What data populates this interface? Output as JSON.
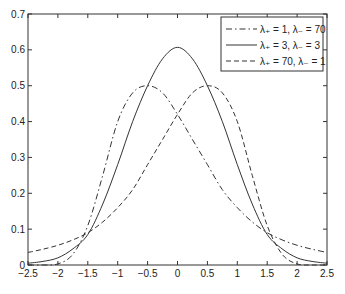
{
  "chart_data": {
    "type": "line",
    "title": "",
    "xlabel": "",
    "ylabel": "",
    "xlim": [
      -2.5,
      2.5
    ],
    "ylim": [
      0,
      0.7
    ],
    "xticks": [
      "-2.5",
      "-2",
      "-1.5",
      "-1",
      "-0.5",
      "0",
      "0.5",
      "1",
      "1.5",
      "2",
      "2.5"
    ],
    "yticks": [
      "0",
      "0.1",
      "0.2",
      "0.3",
      "0.4",
      "0.5",
      "0.6",
      "0.7"
    ],
    "grid": false,
    "legend_position": "upper right",
    "x": [
      -2.5,
      -2.25,
      -2.0,
      -1.75,
      -1.5,
      -1.25,
      -1.0,
      -0.75,
      -0.5,
      -0.25,
      0.0,
      0.25,
      0.5,
      0.75,
      1.0,
      1.25,
      1.5,
      1.75,
      2.0,
      2.25,
      2.5
    ],
    "series": [
      {
        "name": "λ+ = 1, λ− = 70",
        "style": "dashdot",
        "values": [
          0.0,
          0.0,
          0.003,
          0.03,
          0.11,
          0.25,
          0.4,
          0.48,
          0.5,
          0.48,
          0.42,
          0.35,
          0.28,
          0.21,
          0.16,
          0.12,
          0.09,
          0.07,
          0.055,
          0.044,
          0.035
        ]
      },
      {
        "name": "λ+ = 3, λ− = 3",
        "style": "solid",
        "values": [
          0.005,
          0.01,
          0.02,
          0.045,
          0.085,
          0.17,
          0.28,
          0.4,
          0.5,
          0.575,
          0.607,
          0.575,
          0.5,
          0.4,
          0.28,
          0.17,
          0.085,
          0.045,
          0.02,
          0.01,
          0.005
        ]
      },
      {
        "name": "λ+ = 70, λ− = 1",
        "style": "dashed",
        "values": [
          0.035,
          0.044,
          0.055,
          0.07,
          0.09,
          0.12,
          0.16,
          0.21,
          0.28,
          0.35,
          0.42,
          0.48,
          0.5,
          0.48,
          0.4,
          0.25,
          0.11,
          0.03,
          0.003,
          0.0,
          0.0
        ]
      }
    ]
  },
  "legend": {
    "items": [
      {
        "label": "λ₊ = 1, λ₋ = 70",
        "style": "dashdot"
      },
      {
        "label": "λ₊ = 3, λ₋ = 3",
        "style": "solid"
      },
      {
        "label": "λ₊ = 70, λ₋ = 1",
        "style": "dashed"
      }
    ]
  }
}
